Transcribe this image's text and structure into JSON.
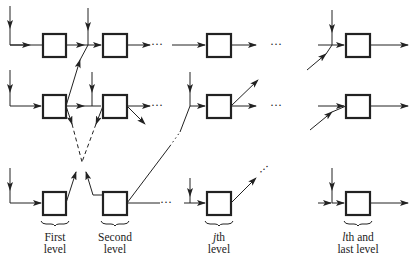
{
  "diagram": {
    "type": "multi-level cascade network",
    "colors": {
      "stroke": "#222222",
      "background": "#ffffff"
    },
    "rows_y": [
      45,
      106,
      203
    ],
    "columns": [
      {
        "name": "first",
        "box_x": 43
      },
      {
        "name": "second",
        "box_x": 103
      },
      {
        "name": "jth",
        "box_x": 207
      },
      {
        "name": "lth",
        "box_x": 346
      }
    ],
    "ellipsis": "· · ·"
  },
  "labels": {
    "first": {
      "line1": "First",
      "line2": "level"
    },
    "second": {
      "line1": "Second",
      "line2": "level"
    },
    "jth": {
      "var": "j",
      "line1_rest": "th",
      "line2": "level"
    },
    "last": {
      "var": "l",
      "line1_rest": "th and",
      "line2": "last level"
    }
  }
}
